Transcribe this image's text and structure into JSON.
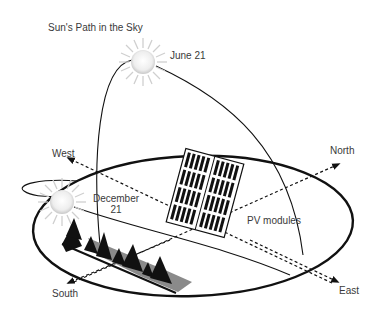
{
  "title": "Sun's Path in the Sky",
  "labels": {
    "june": "June 21",
    "december_line1": "December",
    "december_line2": "21",
    "west": "West",
    "north": "North",
    "south": "South",
    "east": "East",
    "pv": "PV modules"
  },
  "icons": {
    "sun_summer": "sun-icon",
    "sun_winter": "sun-icon",
    "solar_panel": "solar-panel-icon",
    "trees": "tree-icon"
  },
  "colors": {
    "line": "#111111",
    "text": "#3a3a3a",
    "sun_core": "#f4f4f4",
    "sun_rays": "#cfcfcf",
    "tree": "#111111",
    "tree_shadow": "#8a8a8a"
  }
}
